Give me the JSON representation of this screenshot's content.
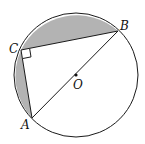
{
  "figure": {
    "type": "geometry",
    "points": {
      "A": {
        "label": "A",
        "x": 32,
        "y": 118
      },
      "B": {
        "label": "B",
        "x": 118,
        "y": 31
      },
      "C": {
        "label": "C",
        "x": 21,
        "y": 50
      },
      "O": {
        "label": "O",
        "x": 76,
        "y": 75
      }
    },
    "circle": {
      "cx": 76,
      "cy": 75,
      "r": 62
    },
    "right_angle_at": "C",
    "shaded_regions": [
      "segment-CB",
      "segment-CA"
    ],
    "colors": {
      "stroke": "#1a1a1a",
      "shade": "#b3b3b3",
      "background": "#ffffff"
    }
  }
}
